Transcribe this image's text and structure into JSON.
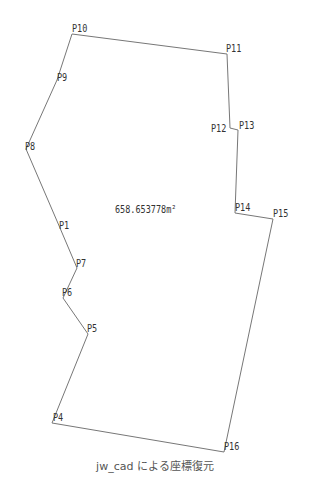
{
  "drawing": {
    "stroke_color": "#777777",
    "area_label": "658.653778m²",
    "polygon_order": [
      "P10",
      "P11",
      "P12",
      "P13",
      "P14",
      "P15",
      "P16",
      "P4",
      "P5",
      "P6",
      "P7",
      "P1",
      "P8",
      "P9"
    ],
    "points": [
      {
        "id": "P10",
        "label": "P10",
        "x": 72,
        "y": 34,
        "lx": 72,
        "ly": 24
      },
      {
        "id": "P11",
        "label": "P11",
        "x": 227,
        "y": 54,
        "lx": 226,
        "ly": 44
      },
      {
        "id": "P12",
        "label": "P12",
        "x": 230,
        "y": 128,
        "lx": 211,
        "ly": 124
      },
      {
        "id": "P13",
        "label": "P13",
        "x": 238,
        "y": 130,
        "lx": 239,
        "ly": 121
      },
      {
        "id": "P14",
        "label": "P14",
        "x": 235,
        "y": 213,
        "lx": 235,
        "ly": 203
      },
      {
        "id": "P15",
        "label": "P15",
        "x": 273,
        "y": 219,
        "lx": 273,
        "ly": 209
      },
      {
        "id": "P16",
        "label": "P16",
        "x": 224,
        "y": 452,
        "lx": 224,
        "ly": 442
      },
      {
        "id": "P4",
        "label": "P4",
        "x": 52,
        "y": 423,
        "lx": 53,
        "ly": 413
      },
      {
        "id": "P5",
        "label": "P5",
        "x": 88,
        "y": 334,
        "lx": 87,
        "ly": 324
      },
      {
        "id": "P6",
        "label": "P6",
        "x": 63,
        "y": 298,
        "lx": 62,
        "ly": 288
      },
      {
        "id": "P7",
        "label": "P7",
        "x": 77,
        "y": 268,
        "lx": 76,
        "ly": 259
      },
      {
        "id": "P1",
        "label": "P1",
        "x": 60,
        "y": 228,
        "lx": 59,
        "ly": 221
      },
      {
        "id": "P8",
        "label": "P8",
        "x": 26,
        "y": 149,
        "lx": 25,
        "ly": 142
      },
      {
        "id": "P9",
        "label": "P9",
        "x": 57,
        "y": 80,
        "lx": 57,
        "ly": 73
      }
    ],
    "area_position": {
      "x": 115,
      "y": 205
    }
  },
  "caption": "jw_cad による座標復元"
}
